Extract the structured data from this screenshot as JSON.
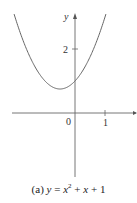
{
  "chart_data": {
    "type": "line",
    "function": "y = x^2 + x + 1",
    "xlabel": "",
    "ylabel": "y",
    "x_ticks": [
      {
        "value": 1,
        "label": "1"
      }
    ],
    "y_ticks": [
      {
        "value": 2,
        "label": "2"
      }
    ],
    "origin_label": "0",
    "xlim": [
      -2.1,
      2.1
    ],
    "ylim": [
      -2,
      3.05
    ],
    "grid": false,
    "legend": null,
    "series": [
      {
        "name": "y = x^2 + x + 1",
        "x": [
          -2.0,
          -1.5,
          -1.0,
          -0.5,
          0.0,
          0.5,
          1.0
        ],
        "y": [
          3.0,
          1.75,
          1.0,
          0.75,
          1.0,
          1.75,
          3.0
        ]
      }
    ],
    "vertex": {
      "x": -0.5,
      "y": 0.75
    }
  },
  "labels": {
    "y_axis": "y",
    "origin": "0",
    "x_tick_1": "1",
    "y_tick_2": "2",
    "caption_prefix": "(a) ",
    "caption_y": "y",
    "caption_eq": " = ",
    "caption_x": "x",
    "caption_exp": "2",
    "caption_plus": " + ",
    "caption_x2": "x",
    "caption_tail": " + 1"
  },
  "colors": {
    "curve": "#666666",
    "axis": "#555555"
  }
}
